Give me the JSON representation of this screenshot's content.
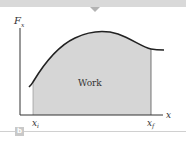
{
  "figure": {
    "y_axis_label": "F",
    "y_axis_sub": "x",
    "x_axis_label": "x",
    "area_label": "Work",
    "x_initial_label": "x",
    "x_initial_sub": "i",
    "x_final_label": "x",
    "x_final_sub": "f",
    "panel_label": "b"
  },
  "colors": {
    "topbar": "#d9d9d9",
    "area_fill": "#d6d6d6",
    "curve": "#222222",
    "axis": "#333333",
    "panel_badge": "#c9c9c9"
  }
}
